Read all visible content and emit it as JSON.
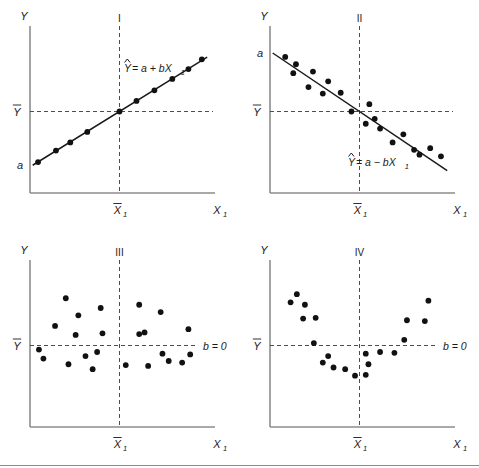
{
  "figure": {
    "title": "",
    "panel_count": 4
  },
  "chart_data": [
    {
      "type": "scatter",
      "panel": "I",
      "title": "I",
      "description": "Perfect positive linear relationship; all points lie on the regression line",
      "xlabel": "X1",
      "ylabel": "Y",
      "xlim": [
        0,
        10
      ],
      "ylim": [
        0,
        10
      ],
      "grid": false,
      "legend": "none",
      "annotations": {
        "equation": "= a + bX",
        "equation_hat": "Y",
        "equation_sub": "1",
        "intercept_label": "a",
        "ymean_label": "Y",
        "xmean_label": "X",
        "xmean_sub": "1",
        "xaxis_end_label": "X",
        "xaxis_end_sub": "1"
      },
      "reference_lines": {
        "ymean": 5.0,
        "xmean": 5.0
      },
      "line": {
        "intercept": 1.6,
        "slope": 0.68
      },
      "points": [
        {
          "x": 0.45,
          "y": 1.9
        },
        {
          "x": 1.45,
          "y": 2.6
        },
        {
          "x": 2.25,
          "y": 3.1
        },
        {
          "x": 3.2,
          "y": 3.75
        },
        {
          "x": 5.0,
          "y": 5.0
        },
        {
          "x": 5.95,
          "y": 5.65
        },
        {
          "x": 6.95,
          "y": 6.3
        },
        {
          "x": 7.95,
          "y": 7.0
        },
        {
          "x": 8.85,
          "y": 7.6
        },
        {
          "x": 9.6,
          "y": 8.2
        }
      ]
    },
    {
      "type": "scatter",
      "panel": "II",
      "title": "II",
      "description": "Negative linear relationship with scatter around the regression line",
      "xlabel": "X1",
      "ylabel": "Y",
      "xlim": [
        0,
        10
      ],
      "ylim": [
        0,
        10
      ],
      "grid": false,
      "legend": "none",
      "annotations": {
        "equation": "= a − bX",
        "equation_hat": "Y",
        "equation_sub": "1",
        "intercept_label": "a",
        "ymean_label": "Y",
        "xmean_label": "X",
        "xmean_sub": "1",
        "xaxis_end_label": "X",
        "xaxis_end_sub": "1"
      },
      "reference_lines": {
        "ymean": 5.0,
        "xmean": 5.0
      },
      "line": {
        "intercept": 8.7,
        "slope": -0.74
      },
      "points": [
        {
          "x": 0.85,
          "y": 8.35
        },
        {
          "x": 1.45,
          "y": 7.9
        },
        {
          "x": 1.3,
          "y": 7.35
        },
        {
          "x": 2.4,
          "y": 7.45
        },
        {
          "x": 2.15,
          "y": 6.5
        },
        {
          "x": 3.25,
          "y": 6.85
        },
        {
          "x": 2.95,
          "y": 6.1
        },
        {
          "x": 3.95,
          "y": 6.15
        },
        {
          "x": 4.55,
          "y": 5.0
        },
        {
          "x": 5.55,
          "y": 5.45
        },
        {
          "x": 5.85,
          "y": 4.55
        },
        {
          "x": 6.15,
          "y": 3.95
        },
        {
          "x": 5.35,
          "y": 4.25
        },
        {
          "x": 6.85,
          "y": 3.1
        },
        {
          "x": 7.45,
          "y": 3.6
        },
        {
          "x": 8.05,
          "y": 2.65
        },
        {
          "x": 8.35,
          "y": 2.35
        },
        {
          "x": 8.95,
          "y": 2.75
        },
        {
          "x": 9.55,
          "y": 2.25
        }
      ]
    },
    {
      "type": "scatter",
      "panel": "III",
      "title": "III",
      "description": "No relationship; random scatter with zero slope",
      "xlabel": "X1",
      "ylabel": "Y",
      "xlim": [
        0,
        10
      ],
      "ylim": [
        0,
        10
      ],
      "grid": false,
      "legend": "none",
      "annotations": {
        "slope_label": "b = 0",
        "ymean_label": "Y",
        "xmean_label": "X",
        "xmean_sub": "1",
        "xaxis_end_label": "X",
        "xaxis_end_sub": "1"
      },
      "reference_lines": {
        "ymean": 5.0,
        "xmean": 5.0
      },
      "line": {
        "intercept": 5.0,
        "slope": 0.0
      },
      "points": [
        {
          "x": 0.5,
          "y": 4.75
        },
        {
          "x": 0.75,
          "y": 4.2
        },
        {
          "x": 1.4,
          "y": 6.2
        },
        {
          "x": 2.0,
          "y": 7.9
        },
        {
          "x": 2.55,
          "y": 5.65
        },
        {
          "x": 2.7,
          "y": 6.85
        },
        {
          "x": 2.15,
          "y": 3.85
        },
        {
          "x": 3.1,
          "y": 4.35
        },
        {
          "x": 3.5,
          "y": 3.55
        },
        {
          "x": 3.95,
          "y": 7.3
        },
        {
          "x": 4.05,
          "y": 5.75
        },
        {
          "x": 3.75,
          "y": 4.6
        },
        {
          "x": 5.35,
          "y": 3.8
        },
        {
          "x": 6.1,
          "y": 7.5
        },
        {
          "x": 6.4,
          "y": 5.8
        },
        {
          "x": 6.1,
          "y": 5.7
        },
        {
          "x": 6.6,
          "y": 3.75
        },
        {
          "x": 7.3,
          "y": 7.05
        },
        {
          "x": 7.4,
          "y": 4.5
        },
        {
          "x": 7.75,
          "y": 4.05
        },
        {
          "x": 8.5,
          "y": 3.95
        },
        {
          "x": 8.85,
          "y": 6.0
        },
        {
          "x": 8.95,
          "y": 4.45
        }
      ]
    },
    {
      "type": "scatter",
      "panel": "IV",
      "title": "IV",
      "description": "Curvilinear U-shaped relationship; linear slope is zero",
      "xlabel": "X1",
      "ylabel": "Y",
      "xlim": [
        0,
        10
      ],
      "ylim": [
        0,
        10
      ],
      "grid": false,
      "legend": "none",
      "annotations": {
        "slope_label": "b = 0",
        "ymean_label": "Y",
        "xmean_label": "X",
        "xmean_sub": "1",
        "xaxis_end_label": "X",
        "xaxis_end_sub": "1"
      },
      "reference_lines": {
        "ymean": 5.0,
        "xmean": 5.0
      },
      "line": {
        "intercept": 5.0,
        "slope": 0.0
      },
      "points": [
        {
          "x": 1.15,
          "y": 7.65
        },
        {
          "x": 1.5,
          "y": 8.15
        },
        {
          "x": 1.95,
          "y": 7.5
        },
        {
          "x": 1.85,
          "y": 6.65
        },
        {
          "x": 2.55,
          "y": 6.7
        },
        {
          "x": 2.45,
          "y": 5.15
        },
        {
          "x": 3.25,
          "y": 4.35
        },
        {
          "x": 2.95,
          "y": 3.95
        },
        {
          "x": 3.55,
          "y": 3.65
        },
        {
          "x": 4.2,
          "y": 3.55
        },
        {
          "x": 4.75,
          "y": 3.15
        },
        {
          "x": 5.35,
          "y": 3.2
        },
        {
          "x": 5.5,
          "y": 3.85
        },
        {
          "x": 5.35,
          "y": 4.5
        },
        {
          "x": 6.15,
          "y": 4.6
        },
        {
          "x": 6.95,
          "y": 4.55
        },
        {
          "x": 7.5,
          "y": 5.35
        },
        {
          "x": 7.65,
          "y": 6.55
        },
        {
          "x": 8.65,
          "y": 6.5
        },
        {
          "x": 8.85,
          "y": 7.75
        }
      ]
    }
  ]
}
